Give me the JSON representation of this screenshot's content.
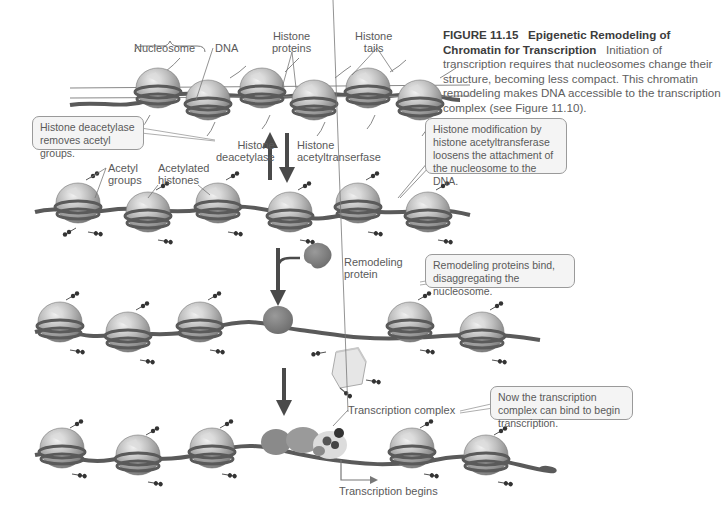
{
  "figure": {
    "number": "FIGURE 11.15",
    "title": "Epigenetic Remodeling of Chromatin for Transcription",
    "caption": "Initiation of transcription requires that nucleosomes change their structure, becoming less compact. This chromatin remodeling makes DNA accessible to the transcription complex (see Figure 11.10)."
  },
  "labels": {
    "nucleosome": "Nucleosome",
    "dna": "DNA",
    "histone_proteins": [
      "Histone",
      "proteins"
    ],
    "histone_tails": [
      "Histone",
      "tails"
    ],
    "histone_deacetylase": [
      "Histone",
      "deacetylase"
    ],
    "histone_acetyltransferase": [
      "Histone",
      "acetyltranserfase"
    ],
    "acetyl_groups": [
      "Acetyl",
      "groups"
    ],
    "acetylated_histones": [
      "Acetylated",
      "histones"
    ],
    "remodeling_protein": [
      "Remodeling",
      "protein"
    ],
    "transcription_complex": "Transcription complex",
    "transcription_begins": "Transcription begins"
  },
  "callouts": {
    "deacetylase": "Histone deacetylase removes acetyl groups.",
    "acetyltransferase": "Histone modification by histone acetyltransferase loosens the attachment of the nucleosome to the DNA.",
    "remodeling": "Remodeling proteins bind, disaggregating the nucleosome.",
    "transcription": "Now the transcription complex can bind to begin transcription."
  },
  "stages": [
    {
      "name": "compact-chromatin",
      "nucleosomes": 6
    },
    {
      "name": "acetylated-chromatin",
      "nucleosomes": 6
    },
    {
      "name": "remodeling-bound",
      "nucleosomes": 5
    },
    {
      "name": "transcription-complex-bound",
      "nucleosomes": 5
    }
  ],
  "colors": {
    "dna": "#5a5a5a",
    "histone_core": "#b8b8b8",
    "remodeling_protein": "#7a7a7a",
    "arrow": "#4a4a4a",
    "callout_border": "#9a9a9a",
    "callout_fill": "#f4f4f4"
  }
}
